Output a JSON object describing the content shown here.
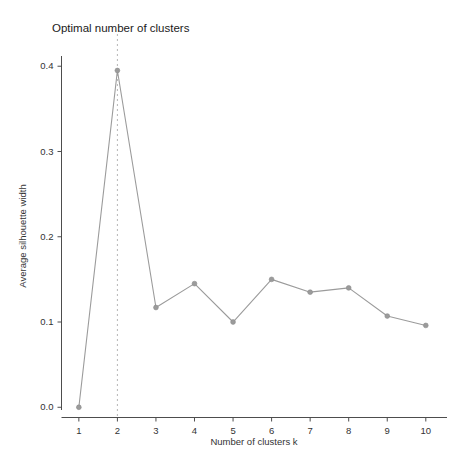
{
  "chart_data": {
    "type": "line",
    "title": "Optimal number of clusters",
    "xlabel": "Number of clusters k",
    "ylabel": "Average silhouette width",
    "x": [
      1,
      2,
      3,
      4,
      5,
      6,
      7,
      8,
      9,
      10
    ],
    "categories": [
      "1",
      "2",
      "3",
      "4",
      "5",
      "6",
      "7",
      "8",
      "9",
      "10"
    ],
    "values": [
      0.0,
      0.395,
      0.117,
      0.145,
      0.1,
      0.15,
      0.135,
      0.14,
      0.107,
      0.096
    ],
    "series": [
      {
        "name": "Average silhouette width",
        "values": [
          0.0,
          0.395,
          0.117,
          0.145,
          0.1,
          0.15,
          0.135,
          0.14,
          0.107,
          0.096
        ]
      }
    ],
    "xlim": [
      0.55,
      10.55
    ],
    "ylim": [
      -0.012,
      0.412
    ],
    "xticks": [
      1,
      2,
      3,
      4,
      5,
      6,
      7,
      8,
      9,
      10
    ],
    "xticklabels": [
      "1",
      "2",
      "3",
      "4",
      "5",
      "6",
      "7",
      "8",
      "9",
      "10"
    ],
    "yticks": [
      0.0,
      0.1,
      0.2,
      0.3,
      0.4
    ],
    "yticklabels": [
      "0.0",
      "0.1",
      "0.2",
      "0.3",
      "0.4"
    ],
    "grid": false,
    "legend": null,
    "annotations": [
      {
        "name": "optimal-k-vline",
        "type": "vertical-dashed-line",
        "x": 2,
        "label": ""
      }
    ],
    "colors": {
      "line": "#9b9b9b",
      "marker": "#9b9b9b",
      "vline": "#b6b6b6",
      "axis": "#4d4d4d",
      "text": "#333333",
      "title": "#1a1a1a",
      "background": "#ffffff"
    }
  }
}
